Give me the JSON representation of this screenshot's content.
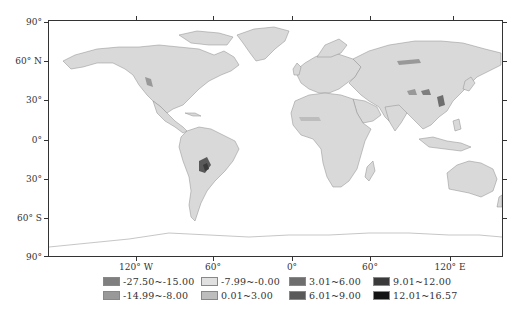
{
  "map": {
    "land_color": "#d9d9d9",
    "border_color": "#8c8c8c",
    "ocean_color": "#ffffff",
    "frame_color": "#333333"
  },
  "axes": {
    "latitude_labels": [
      {
        "label": "90°",
        "y": 22
      },
      {
        "label": "60° N",
        "y": 61
      },
      {
        "label": "30°",
        "y": 100
      },
      {
        "label": "0°",
        "y": 140
      },
      {
        "label": "30°",
        "y": 179
      },
      {
        "label": "60° S",
        "y": 218
      },
      {
        "label": "90°",
        "y": 257
      }
    ],
    "longitude_labels": [
      {
        "label": "120° W",
        "x": 136
      },
      {
        "label": "60°",
        "x": 213
      },
      {
        "label": "0°",
        "x": 292
      },
      {
        "label": "60°",
        "x": 370
      },
      {
        "label": "120° E",
        "x": 450
      }
    ]
  },
  "legend": {
    "items": [
      {
        "label": "-27.50~-15.00",
        "color": "#7f7f7f",
        "col": 0,
        "row": 0
      },
      {
        "label": "-14.99~-8.00",
        "color": "#999999",
        "col": 0,
        "row": 1
      },
      {
        "label": "-7.99~-0.00",
        "color": "#e0e0e0",
        "col": 1,
        "row": 0
      },
      {
        "label": "0.01~3.00",
        "color": "#bdbdbd",
        "col": 1,
        "row": 1
      },
      {
        "label": "3.01~6.00",
        "color": "#6e6e6e",
        "col": 2,
        "row": 0
      },
      {
        "label": "6.01~9.00",
        "color": "#595959",
        "col": 2,
        "row": 1
      },
      {
        "label": "9.01~12.00",
        "color": "#3a3a3a",
        "col": 3,
        "row": 0
      },
      {
        "label": "12.01~16.57",
        "color": "#141414",
        "col": 3,
        "row": 1
      }
    ]
  }
}
